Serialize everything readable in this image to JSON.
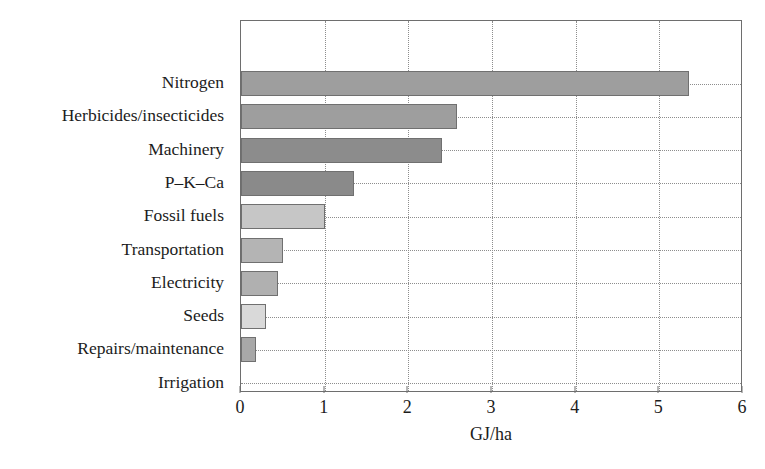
{
  "chart_data": {
    "type": "bar",
    "orientation": "horizontal",
    "title": "",
    "subtitle": "",
    "xlabel": "GJ/ha",
    "ylabel": "",
    "xlim": [
      0,
      6
    ],
    "xticks": [
      "0",
      "1",
      "2",
      "3",
      "4",
      "5",
      "6"
    ],
    "xtick_values": [
      0,
      1,
      2,
      3,
      4,
      5,
      6
    ],
    "grid": "vertical-and-horizontal-dotted",
    "legend": "none",
    "categories": [
      "Nitrogen",
      "Herbicides/insecticides",
      "Machinery",
      "P–K–Ca",
      "Fossil fuels",
      "Transportation",
      "Electricity",
      "Seeds",
      "Repairs/maintenance",
      "Irrigation"
    ],
    "values": [
      5.35,
      2.58,
      2.4,
      1.35,
      1.0,
      0.5,
      0.44,
      0.3,
      0.18,
      0.0
    ],
    "bar_colors": [
      "#9e9e9e",
      "#9e9e9e",
      "#8c8c8c",
      "#8a8a8a",
      "#c6c6c6",
      "#b4b4b4",
      "#b0b0b0",
      "#d9d9d9",
      "#a8a8a8",
      "#bfbfbf"
    ],
    "bar_edge_color": "#707070",
    "axis_color": "#6e6e6e",
    "grid_color": "#8d8d8d",
    "text_color": "#1c1c1c",
    "background": "#ffffff"
  }
}
